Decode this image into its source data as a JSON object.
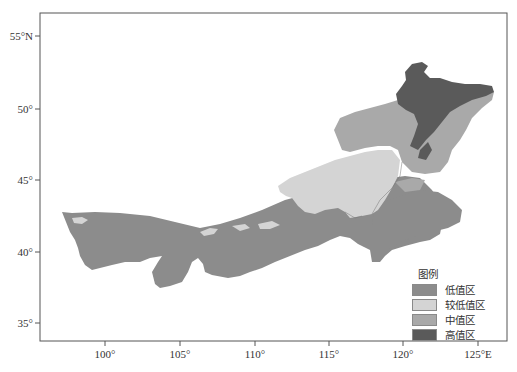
{
  "map": {
    "frame": {
      "left": 40,
      "top": 13,
      "right": 507,
      "bottom": 341
    },
    "y_axis": {
      "ticks": [
        {
          "label": "55°N",
          "value": 55,
          "y": 36
        },
        {
          "label": "50°",
          "value": 50,
          "y": 109
        },
        {
          "label": "45°",
          "value": 45,
          "y": 180
        },
        {
          "label": "40°",
          "value": 40,
          "y": 252
        },
        {
          "label": "35°",
          "value": 35,
          "y": 323
        }
      ]
    },
    "x_axis": {
      "ticks": [
        {
          "label": "100°",
          "value": 100,
          "x": 105
        },
        {
          "label": "105°",
          "value": 105,
          "x": 180
        },
        {
          "label": "110°",
          "value": 110,
          "x": 255
        },
        {
          "label": "115°",
          "value": 115,
          "x": 329
        },
        {
          "label": "120°",
          "value": 120,
          "x": 403
        },
        {
          "label": "125°E",
          "value": 125,
          "x": 478
        }
      ]
    },
    "legend": {
      "title": "图例",
      "items": [
        {
          "label": "低值区",
          "color": "#8c8c8c"
        },
        {
          "label": "较低值区",
          "color": "#d4d4d4"
        },
        {
          "label": "中值区",
          "color": "#a9a9a9"
        },
        {
          "label": "高值区",
          "color": "#5a5a5a"
        }
      ]
    }
  }
}
